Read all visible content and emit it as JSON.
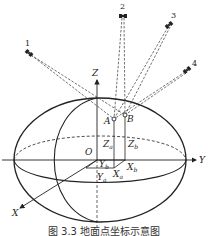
{
  "figure": {
    "caption": "图 3.3 地面点坐标示意图",
    "colors": {
      "ink": "#222222",
      "background": "#ffffff"
    },
    "axes": [
      {
        "name": "X",
        "label": "X"
      },
      {
        "name": "Y",
        "label": "Y"
      },
      {
        "name": "Z",
        "label": "Z"
      }
    ],
    "origin": {
      "label": "O"
    },
    "points": [
      {
        "label": "A",
        "coords": {
          "x": "X",
          "x_sub": "a",
          "y": "Y",
          "y_sub": "a",
          "z": "Z",
          "z_sub": "a"
        }
      },
      {
        "label": "B",
        "coords": {
          "x": "X",
          "x_sub": "b",
          "y": "Y",
          "y_sub": "b",
          "z": "Z",
          "z_sub": "b"
        }
      }
    ],
    "satellites": [
      {
        "label": "1",
        "icon": "satellite-icon"
      },
      {
        "label": "2",
        "icon": "satellite-icon"
      },
      {
        "label": "3",
        "icon": "satellite-icon"
      },
      {
        "label": "4",
        "icon": "satellite-icon"
      }
    ]
  }
}
